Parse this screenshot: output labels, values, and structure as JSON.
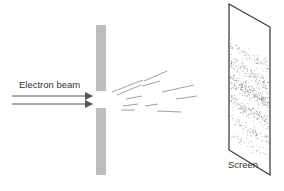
{
  "diagram": {
    "labels": {
      "beam": "Electron beam",
      "screen": "Screen"
    },
    "colors": {
      "barrier": "#bdbdbd",
      "line": "#444444",
      "rays": "#777777",
      "dots": "#555555"
    },
    "elements": [
      {
        "id": "electron-beam",
        "type": "arrows",
        "count": 2
      },
      {
        "id": "slit-barrier",
        "type": "barrier-with-gap"
      },
      {
        "id": "diffracted-rays",
        "type": "fan-of-lines",
        "count": 10
      },
      {
        "id": "screen",
        "type": "parallelogram",
        "pattern": "interference-bands"
      }
    ]
  }
}
